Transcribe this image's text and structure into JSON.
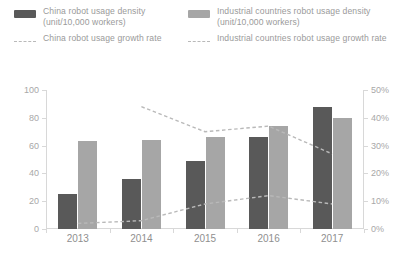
{
  "legend": {
    "items": [
      {
        "mark": "swatch",
        "color": "#595959",
        "label": "China robot usage density (unit/10,000 workers)",
        "column": "left"
      },
      {
        "mark": "dashed",
        "color": "#b9b9b9",
        "label": "China robot usage growth rate",
        "column": "left"
      },
      {
        "mark": "swatch",
        "color": "#a6a6a6",
        "label": "Industrial countries robot usage density (unit/10,000 workers)",
        "column": "right"
      },
      {
        "mark": "dashed",
        "color": "#b9b9b9",
        "label": "Industrial countries robot usage growth rate",
        "column": "right"
      }
    ]
  },
  "axes": {
    "left_ticks": [
      "100",
      "80",
      "60",
      "40",
      "20",
      "0"
    ],
    "right_ticks": [
      "50%",
      "40%",
      "30%",
      "20%",
      "10%",
      "0%"
    ],
    "x_ticks": [
      "2013",
      "2014",
      "2015",
      "2016",
      "2017"
    ]
  },
  "chart_data": {
    "type": "bar",
    "title": "",
    "xlabel": "",
    "ylabel": "",
    "y2label": "",
    "categories": [
      "2013",
      "2014",
      "2015",
      "2016",
      "2017"
    ],
    "ylim": [
      0,
      100
    ],
    "y2lim": [
      0,
      50
    ],
    "grid": false,
    "legend_position": "top",
    "series": [
      {
        "name": "China robot usage density (unit/10,000 workers)",
        "type": "bar",
        "axis": "left",
        "color": "#595959",
        "values": [
          25,
          36,
          49,
          66,
          88
        ]
      },
      {
        "name": "Industrial countries robot usage density (unit/10,000 workers)",
        "type": "bar",
        "axis": "left",
        "color": "#a6a6a6",
        "values": [
          63,
          64,
          66,
          74,
          80
        ]
      },
      {
        "name": "China robot usage growth rate",
        "type": "line",
        "axis": "right",
        "color": "#b9b9b9",
        "style": "dashed",
        "values": [
          null,
          44,
          35,
          37,
          27
        ]
      },
      {
        "name": "Industrial countries robot usage growth rate",
        "type": "line",
        "axis": "right",
        "color": "#b9b9b9",
        "style": "dashed",
        "values": [
          2,
          3,
          9,
          12,
          9
        ]
      }
    ]
  }
}
